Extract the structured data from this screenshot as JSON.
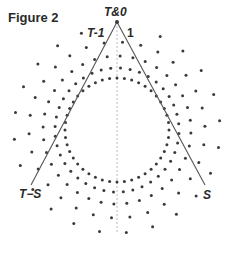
{
  "figure": {
    "title": "Figure 2",
    "labels": {
      "apex": "T&0",
      "left_near_apex": "T-1",
      "right_near_apex": "1",
      "left_base": "T−S",
      "right_base": "S"
    },
    "geometry": {
      "apex": [
        117,
        22
      ],
      "left_end": [
        31,
        185
      ],
      "right_end": [
        205,
        185
      ],
      "axis_x": 117,
      "axis_y_range": [
        22,
        234
      ],
      "center": [
        117,
        130
      ],
      "rings": [
        {
          "radius": 52,
          "count": 44
        },
        {
          "radius": 62,
          "count": 40
        },
        {
          "radius": 74,
          "count": 36
        },
        {
          "radius": 88,
          "count": 30
        },
        {
          "radius": 103,
          "count": 24
        }
      ]
    },
    "colors": {
      "dot": "#3a3a3a",
      "line": "#555555",
      "dashed_axis": "#aaaaaa"
    }
  }
}
